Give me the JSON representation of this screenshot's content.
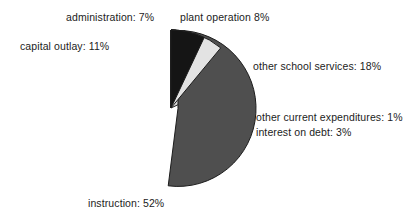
{
  "chart_data": {
    "type": "pie",
    "title": "",
    "unit": "%",
    "legend_position": "callout-labels",
    "total": 100,
    "categories": [
      "plant operation",
      "other school services",
      "other current expenditures",
      "interest on debt",
      "instruction",
      "capital outlay",
      "administration"
    ],
    "values": [
      8,
      18,
      1,
      3,
      52,
      11,
      7
    ],
    "slices": [
      {
        "name": "plant operation",
        "label": "plant operation 8%",
        "value": 8,
        "color": "#ffffff",
        "stroke": "#1c1c1c",
        "exploded": false
      },
      {
        "name": "other school services",
        "label": "other school services: 18%",
        "value": 18,
        "color": "#d9d9d9",
        "stroke": "#1c1c1c",
        "exploded": false
      },
      {
        "name": "other current expenditures",
        "label": "other current expenditures: 1%",
        "value": 1,
        "color": "#e6e6e6",
        "stroke": "#1c1c1c",
        "exploded": false
      },
      {
        "name": "interest on debt",
        "label": "interest on debt: 3%",
        "value": 3,
        "color": "#8a8a8a",
        "stroke": "#1c1c1c",
        "exploded": false
      },
      {
        "name": "instruction",
        "label": "instruction: 52%",
        "value": 52,
        "color": "#4f4f4f",
        "stroke": "#1c1c1c",
        "exploded": true
      },
      {
        "name": "capital outlay",
        "label": "capital outlay: 11%",
        "value": 11,
        "color": "#e3e3e3",
        "stroke": "#1c1c1c",
        "exploded": false
      },
      {
        "name": "administration",
        "label": "administration: 7%",
        "value": 7,
        "color": "#151515",
        "stroke": "#1c1c1c",
        "exploded": false
      }
    ],
    "geometry": {
      "cx": 171,
      "cy": 108,
      "radius": 78,
      "start_angle_deg": -90,
      "direction": "clockwise",
      "explode_offset": 7
    },
    "colors": {
      "background": "#ffffff",
      "text": "#1c1c1c",
      "outline": "#1c1c1c"
    }
  },
  "labels": {
    "administration": "administration: 7%",
    "plant_operation": "plant operation 8%",
    "capital_outlay": "capital outlay: 11%",
    "other_school_services": "other school services: 18%",
    "other_current_expenditures": "other current expenditures: 1%",
    "interest_on_debt": "interest on debt: 3%",
    "instruction": "instruction: 52%"
  }
}
